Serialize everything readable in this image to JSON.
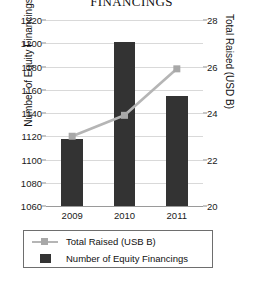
{
  "chart_data": {
    "type": "bar",
    "title": "FINANCINGS",
    "categories": [
      "2009",
      "2010",
      "2011"
    ],
    "xlabel": "",
    "series": [
      {
        "name": "Number of Equity Financings",
        "type": "bar",
        "axis": "left",
        "color": "#333333",
        "values": [
          1118,
          1201,
          1155
        ]
      },
      {
        "name": "Total Raised (USB B)",
        "type": "line",
        "axis": "right",
        "color": "#b5b5b5",
        "marker": "square",
        "values": [
          23.0,
          23.9,
          25.9
        ]
      }
    ],
    "axes": {
      "left": {
        "label": "Number of Equity Financings",
        "ticks": [
          1060,
          1080,
          1100,
          1120,
          1140,
          1160,
          1180,
          1200,
          1220
        ],
        "lim": [
          1060,
          1220
        ]
      },
      "right": {
        "label": "Total Raised (USD B)",
        "ticks": [
          20,
          22,
          24,
          26,
          28
        ],
        "lim": [
          20,
          28
        ]
      }
    },
    "grid": true,
    "legend": {
      "position": "bottom",
      "entries": [
        {
          "label": "Total Raised (USB B)",
          "key": "line-marker-key"
        },
        {
          "label": "Number of Equity Financings",
          "key": "square-key"
        }
      ]
    }
  },
  "colors": {
    "bar": "#333333",
    "line": "#b5b5b5",
    "grid": "#d9d9d9",
    "axis": "#9a9a9a",
    "text": "#1a1a1a"
  }
}
